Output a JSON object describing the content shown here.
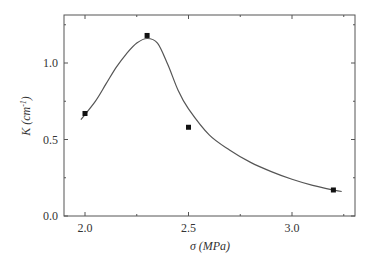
{
  "chart_data": {
    "type": "line",
    "title": "",
    "xlabel": "σ (MPa)",
    "ylabel": "K (cm⁻¹)",
    "xlim": [
      1.9,
      3.33
    ],
    "ylim": [
      0.0,
      1.3
    ],
    "x_ticks": [
      2.0,
      2.5,
      3.0
    ],
    "x_tick_labels": [
      "2.0",
      "2.5",
      "3.0"
    ],
    "y_ticks": [
      0.0,
      0.5,
      1.0
    ],
    "y_tick_labels": [
      "0.0",
      "0.5",
      "1.0"
    ],
    "grid": false,
    "legend": null,
    "series": [
      {
        "name": "measured",
        "style": "scatter-square-markers",
        "x": [
          2.0,
          2.3,
          2.5,
          3.2
        ],
        "y": [
          0.67,
          1.18,
          0.58,
          0.17
        ]
      },
      {
        "name": "fit",
        "style": "smooth-line",
        "x": [
          1.98,
          2.05,
          2.1,
          2.15,
          2.2,
          2.25,
          2.3,
          2.35,
          2.4,
          2.45,
          2.5,
          2.6,
          2.7,
          2.8,
          2.9,
          3.0,
          3.1,
          3.2,
          3.24
        ],
        "y": [
          0.63,
          0.75,
          0.86,
          0.97,
          1.06,
          1.13,
          1.16,
          1.13,
          0.99,
          0.82,
          0.7,
          0.53,
          0.43,
          0.35,
          0.29,
          0.24,
          0.2,
          0.17,
          0.16
        ]
      }
    ]
  },
  "axes": {
    "x_label": "σ (MPa)",
    "y_label_main": "K (cm",
    "y_label_sup": "-1",
    "y_label_close": ")"
  }
}
